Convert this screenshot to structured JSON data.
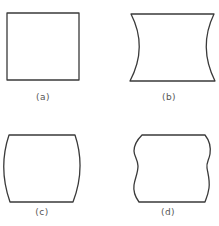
{
  "figure": {
    "panels": [
      {
        "id": "a",
        "label": "(a)",
        "shape": "square"
      },
      {
        "id": "b",
        "label": "(b)",
        "shape": "concave-sided square (pincushion)"
      },
      {
        "id": "c",
        "label": "(c)",
        "shape": "convex-sided square (barrel)"
      },
      {
        "id": "d",
        "label": "(d)",
        "shape": "wavy-sided square"
      }
    ],
    "stroke_color": "#3a3a3a",
    "label_color": "#555555"
  }
}
